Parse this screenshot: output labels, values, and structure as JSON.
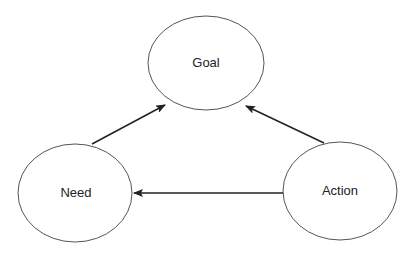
{
  "diagram": {
    "nodes": [
      {
        "id": "goal",
        "label": "Goal",
        "cx": 206,
        "cy": 63,
        "rx": 58,
        "ry": 47
      },
      {
        "id": "need",
        "label": "Need",
        "cx": 75,
        "cy": 193,
        "rx": 57,
        "ry": 49
      },
      {
        "id": "action",
        "label": "Action",
        "cx": 340,
        "cy": 191,
        "rx": 57,
        "ry": 49
      }
    ],
    "edges": [
      {
        "from": "need",
        "to": "goal"
      },
      {
        "from": "action",
        "to": "goal"
      },
      {
        "from": "action",
        "to": "need"
      }
    ],
    "colors": {
      "stroke": "#555555",
      "arrow": "#222222",
      "text": "#222222"
    }
  }
}
